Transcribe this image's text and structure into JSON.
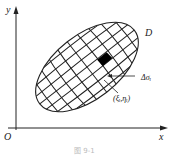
{
  "figure": {
    "axes": {
      "x_label": "x",
      "y_label": "y",
      "origin_label": "O"
    },
    "region_label": "D",
    "element_label": "Δσᵢ",
    "point_label": "(ξᵢ,ηᵢ)",
    "caption": "图 9-1",
    "colors": {
      "line": "#222222",
      "cell_fill": "#000000",
      "background": "#ffffff"
    }
  }
}
